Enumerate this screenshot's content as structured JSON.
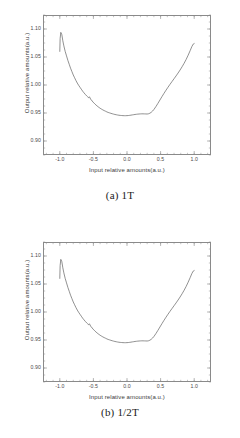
{
  "chart_data": [
    {
      "type": "line",
      "id": "chart-a",
      "title": "",
      "caption": "(a) 1T",
      "xlabel": "Input relative amounts(a.u.)",
      "ylabel": "Output relative amounts(a.u.)",
      "xlim": [
        -1.25,
        1.25
      ],
      "ylim": [
        0.875,
        1.125
      ],
      "xticks": [
        -1.0,
        -0.5,
        0.0,
        0.5,
        1.0
      ],
      "xticklabels": [
        "-1.0",
        "-0.5",
        "0.0",
        "0.5",
        "1.0"
      ],
      "yticks": [
        0.9,
        0.95,
        1.0,
        1.05,
        1.1
      ],
      "yticklabels": [
        "0.90",
        "0.95",
        "1.00",
        "1.05",
        "1.10"
      ],
      "grid": false,
      "legend": null,
      "line_color": "#555555",
      "x": [
        -1.0,
        -0.995,
        -0.985,
        -0.97,
        -0.955,
        -0.94,
        -0.92,
        -0.9,
        -0.88,
        -0.86,
        -0.84,
        -0.82,
        -0.8,
        -0.78,
        -0.76,
        -0.74,
        -0.72,
        -0.7,
        -0.68,
        -0.66,
        -0.64,
        -0.62,
        -0.6,
        -0.585,
        -0.57,
        -0.56,
        -0.55,
        -0.54,
        -0.53,
        -0.52,
        -0.505,
        -0.49,
        -0.475,
        -0.46,
        -0.445,
        -0.43,
        -0.415,
        -0.4,
        -0.38,
        -0.36,
        -0.34,
        -0.32,
        -0.3,
        -0.28,
        -0.26,
        -0.24,
        -0.22,
        -0.2,
        -0.18,
        -0.16,
        -0.14,
        -0.12,
        -0.1,
        -0.08,
        -0.06,
        -0.04,
        -0.02,
        0.0,
        0.02,
        0.04,
        0.06,
        0.08,
        0.1,
        0.12,
        0.14,
        0.16,
        0.18,
        0.2,
        0.22,
        0.24,
        0.26,
        0.28,
        0.3,
        0.32,
        0.34,
        0.36,
        0.38,
        0.4,
        0.43,
        0.46,
        0.49,
        0.52,
        0.55,
        0.58,
        0.61,
        0.64,
        0.67,
        0.7,
        0.73,
        0.76,
        0.79,
        0.82,
        0.85,
        0.88,
        0.91,
        0.94,
        0.965,
        0.985,
        1.0
      ],
      "y": [
        1.06,
        1.083,
        1.094,
        1.09,
        1.079,
        1.07,
        1.06,
        1.052,
        1.044,
        1.037,
        1.03,
        1.024,
        1.018,
        1.013,
        1.008,
        1.0035,
        0.9995,
        0.996,
        0.9925,
        0.989,
        0.986,
        0.9832,
        0.9806,
        0.9788,
        0.9772,
        0.979,
        0.977,
        0.9742,
        0.9735,
        0.9716,
        0.9695,
        0.9676,
        0.9658,
        0.9641,
        0.9626,
        0.9611,
        0.9598,
        0.9585,
        0.957,
        0.9556,
        0.9543,
        0.9532,
        0.952,
        0.951,
        0.9502,
        0.9494,
        0.9487,
        0.948,
        0.9474,
        0.9469,
        0.9464,
        0.946,
        0.9457,
        0.9455,
        0.9453,
        0.9452,
        0.9452,
        0.9453,
        0.9455,
        0.9458,
        0.9462,
        0.9466,
        0.947,
        0.9474,
        0.9477,
        0.948,
        0.9482,
        0.9484,
        0.9485,
        0.9485,
        0.9484,
        0.9483,
        0.9482,
        0.9486,
        0.9496,
        0.9512,
        0.9534,
        0.9562,
        0.9614,
        0.9672,
        0.9732,
        0.9792,
        0.985,
        0.9906,
        0.996,
        1.0012,
        1.0062,
        1.0112,
        1.0162,
        1.0214,
        1.0268,
        1.0326,
        1.0388,
        1.0456,
        1.0532,
        1.0614,
        1.0686,
        1.073,
        1.074
      ]
    },
    {
      "type": "line",
      "id": "chart-b",
      "title": "",
      "caption": "(b) 1/2T",
      "xlabel": "Input relative amounts(a.u.)",
      "ylabel": "Output relative amounts(a.u.)",
      "xlim": [
        -1.25,
        1.25
      ],
      "ylim": [
        0.875,
        1.125
      ],
      "xticks": [
        -1.0,
        -0.5,
        0.0,
        0.5,
        1.0
      ],
      "xticklabels": [
        "-1.0",
        "-0.5",
        "0.0",
        "0.5",
        "1.0"
      ],
      "yticks": [
        0.9,
        0.95,
        1.0,
        1.05,
        1.1
      ],
      "yticklabels": [
        "0.90",
        "0.95",
        "1.00",
        "1.05",
        "1.10"
      ],
      "grid": false,
      "legend": null,
      "line_color": "#555555",
      "x": [
        -1.0,
        -0.995,
        -0.985,
        -0.97,
        -0.955,
        -0.94,
        -0.92,
        -0.9,
        -0.88,
        -0.86,
        -0.84,
        -0.82,
        -0.8,
        -0.78,
        -0.76,
        -0.74,
        -0.72,
        -0.7,
        -0.68,
        -0.66,
        -0.64,
        -0.62,
        -0.6,
        -0.585,
        -0.57,
        -0.56,
        -0.55,
        -0.54,
        -0.53,
        -0.52,
        -0.505,
        -0.49,
        -0.475,
        -0.46,
        -0.445,
        -0.43,
        -0.415,
        -0.4,
        -0.38,
        -0.36,
        -0.34,
        -0.32,
        -0.3,
        -0.28,
        -0.26,
        -0.24,
        -0.22,
        -0.2,
        -0.18,
        -0.16,
        -0.14,
        -0.12,
        -0.1,
        -0.08,
        -0.06,
        -0.04,
        -0.02,
        0.0,
        0.02,
        0.04,
        0.06,
        0.08,
        0.1,
        0.12,
        0.14,
        0.16,
        0.18,
        0.2,
        0.22,
        0.24,
        0.26,
        0.28,
        0.3,
        0.32,
        0.34,
        0.36,
        0.38,
        0.4,
        0.43,
        0.46,
        0.49,
        0.52,
        0.55,
        0.58,
        0.61,
        0.64,
        0.67,
        0.7,
        0.73,
        0.76,
        0.79,
        0.82,
        0.85,
        0.88,
        0.91,
        0.94,
        0.965,
        0.985,
        1.0
      ],
      "y": [
        1.06,
        1.083,
        1.094,
        1.09,
        1.079,
        1.07,
        1.06,
        1.052,
        1.044,
        1.037,
        1.03,
        1.024,
        1.018,
        1.013,
        1.008,
        1.0035,
        0.9995,
        0.996,
        0.9925,
        0.989,
        0.986,
        0.9832,
        0.9806,
        0.9788,
        0.9772,
        0.979,
        0.977,
        0.9742,
        0.9735,
        0.9716,
        0.9695,
        0.9676,
        0.9658,
        0.9641,
        0.9626,
        0.9611,
        0.9598,
        0.9585,
        0.957,
        0.9556,
        0.9543,
        0.9532,
        0.952,
        0.951,
        0.9502,
        0.9494,
        0.9487,
        0.948,
        0.9474,
        0.9469,
        0.9464,
        0.946,
        0.9457,
        0.9455,
        0.9453,
        0.9452,
        0.9452,
        0.9453,
        0.9455,
        0.9458,
        0.9462,
        0.9466,
        0.947,
        0.9474,
        0.9477,
        0.948,
        0.9482,
        0.9484,
        0.9485,
        0.9485,
        0.9484,
        0.9483,
        0.9482,
        0.9486,
        0.9496,
        0.9512,
        0.9534,
        0.9562,
        0.9614,
        0.9672,
        0.9732,
        0.9792,
        0.985,
        0.9906,
        0.996,
        1.0012,
        1.0062,
        1.0112,
        1.0162,
        1.0214,
        1.0268,
        1.0326,
        1.0388,
        1.0456,
        1.0532,
        1.0614,
        1.0686,
        1.073,
        1.074
      ]
    }
  ]
}
